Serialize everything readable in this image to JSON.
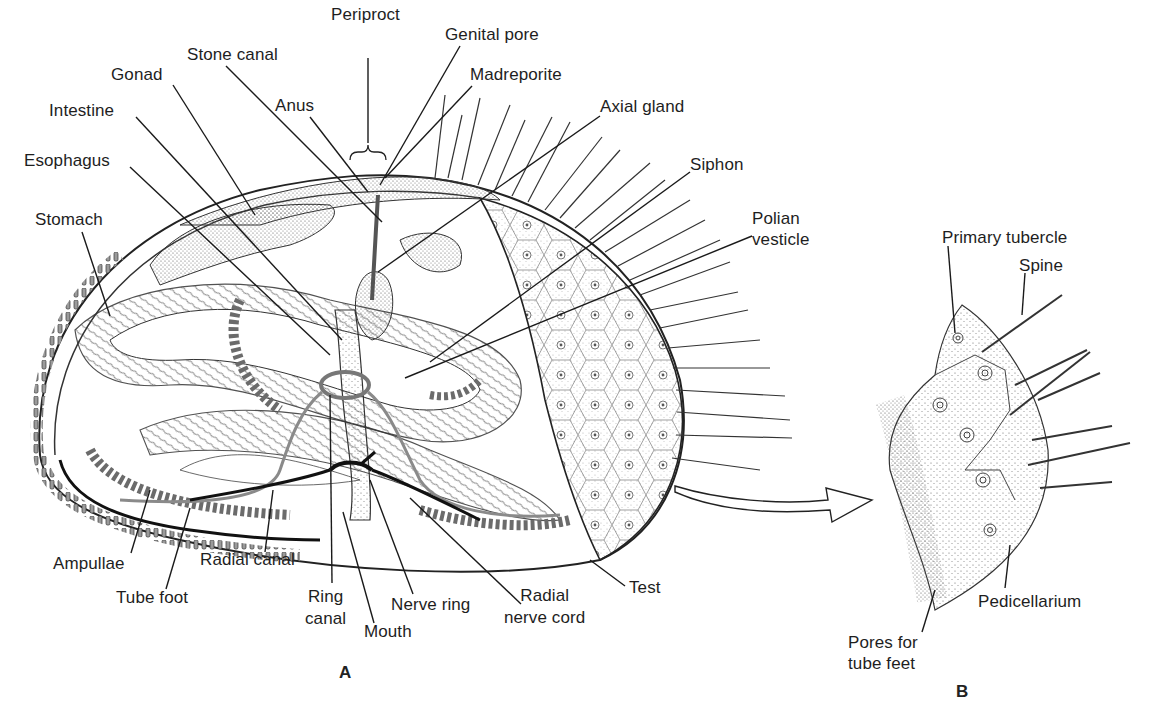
{
  "figure": {
    "panels": [
      {
        "id": "A",
        "letter": "A"
      },
      {
        "id": "B",
        "letter": "B"
      }
    ]
  },
  "labels_a": {
    "periproct": "Periproct",
    "genital_pore": "Genital pore",
    "stone_canal": "Stone canal",
    "madreporite": "Madreporite",
    "gonad": "Gonad",
    "anus": "Anus",
    "axial_gland": "Axial gland",
    "intestine": "Intestine",
    "esophagus": "Esophagus",
    "siphon": "Siphon",
    "polian_vesicle_1": "Polian",
    "polian_vesicle_2": "vesticle",
    "stomach": "Stomach",
    "ampullae": "Ampullae",
    "radial_canal": "Radial canal",
    "tube_foot": "Tube foot",
    "ring_canal_1": "Ring",
    "ring_canal_2": "canal",
    "mouth": "Mouth",
    "nerve_ring": "Nerve ring",
    "radial_nerve_cord_1": "Radial",
    "radial_nerve_cord_2": "nerve cord",
    "test": "Test"
  },
  "labels_b": {
    "primary_tubercle": "Primary tubercle",
    "spine": "Spine",
    "pedicellarium": "Pedicellarium",
    "pores_1": "Pores for",
    "pores_2": "tube feet"
  },
  "colors": {
    "ink": "#1e1e1e",
    "stipple": "#555555",
    "water_vascular": "#8a8a8a",
    "paper": "#ffffff"
  }
}
